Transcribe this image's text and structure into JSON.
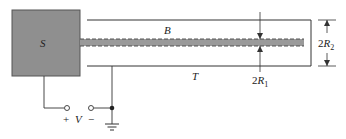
{
  "diagram": {
    "source_box": {
      "label": "S",
      "fill": "#8f8f8f"
    },
    "beam": {
      "label": "B",
      "fill": "#9a9a9a"
    },
    "tube": {
      "label": "T"
    },
    "inner_dimension": {
      "prefix": "2",
      "var": "R",
      "sub": "1"
    },
    "outer_dimension": {
      "prefix": "2",
      "var": "R",
      "sub": "2"
    },
    "voltage": {
      "plus": "+",
      "label": "V",
      "minus": "−"
    },
    "ground_symbol": "ground-icon"
  }
}
